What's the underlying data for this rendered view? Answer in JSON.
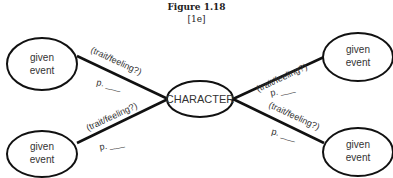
{
  "figure": {
    "title": "Figure 1.18",
    "subtitle": "[1e]"
  },
  "center_node": {
    "label": "CHARACTER"
  },
  "event_nodes": [
    {
      "line1": "given",
      "line2": "event"
    },
    {
      "line1": "given",
      "line2": "event"
    },
    {
      "line1": "given",
      "line2": "event"
    },
    {
      "line1": "given",
      "line2": "event"
    }
  ],
  "edge_labels": [
    {
      "question": "(trait/feeling?)",
      "page": "p. ___"
    },
    {
      "question": "(trait/feeling?)",
      "page": "p. ___"
    },
    {
      "question": "(trait/feeling?)",
      "page": "p. ___"
    },
    {
      "question": "(trait/feeling?)",
      "page": "p. ___"
    }
  ]
}
